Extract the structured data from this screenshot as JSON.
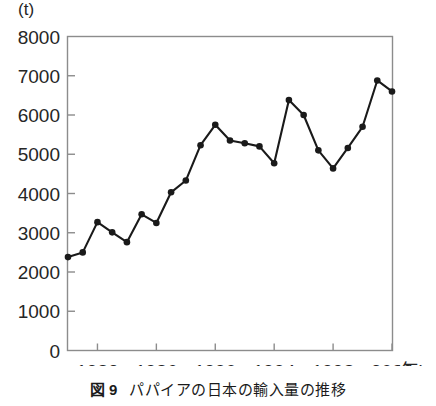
{
  "chart_data": {
    "type": "line",
    "title": "パパイアの日本の輸入量の推移",
    "figure_number": "図 9",
    "xlabel": "年",
    "ylabel": "",
    "unit_label": "(t)",
    "xlim": [
      1980,
      2002
    ],
    "ylim": [
      0,
      8000
    ],
    "grid": false,
    "legend": "none",
    "y_ticks": [
      8000,
      7000,
      6000,
      5000,
      4000,
      3000,
      2000,
      1000,
      0
    ],
    "y_tick_labels": [
      "8000",
      "7000",
      "6000",
      "5000",
      "4000",
      "3000",
      "2000",
      "1000",
      "0"
    ],
    "x_ticks": [
      1982,
      1986,
      1990,
      1994,
      1998,
      2002
    ],
    "x_tick_labels": [
      "1982",
      "1986",
      "1990",
      "1994",
      "1998",
      "2002"
    ],
    "x": [
      1980,
      1981,
      1982,
      1983,
      1984,
      1985,
      1986,
      1987,
      1988,
      1989,
      1990,
      1991,
      1992,
      1993,
      1994,
      1995,
      1996,
      1997,
      1998,
      1999,
      2000,
      2001,
      2002
    ],
    "values": [
      2380,
      2500,
      3270,
      3010,
      2760,
      3470,
      3250,
      4030,
      4330,
      5230,
      5750,
      5350,
      5280,
      5200,
      4770,
      6380,
      6000,
      5100,
      4640,
      5160,
      5700,
      6880,
      6600
    ],
    "series": [
      {
        "name": "パパイアの日本の輸入量",
        "values": [
          2380,
          2500,
          3270,
          3010,
          2760,
          3470,
          3250,
          4030,
          4330,
          5230,
          5750,
          5350,
          5280,
          5200,
          4770,
          6380,
          6000,
          5100,
          4640,
          5160,
          5700,
          6880,
          6600
        ]
      }
    ],
    "marker": "filled-circle",
    "line_color": "#1a1a1a",
    "marker_color": "#1a1a1a",
    "axis_color": "#808080"
  },
  "caption": {
    "number": "図 9",
    "text": "パパイアの日本の輸入量の推移"
  },
  "axes": {
    "unit": "(t)",
    "x_unit": "(年)"
  }
}
